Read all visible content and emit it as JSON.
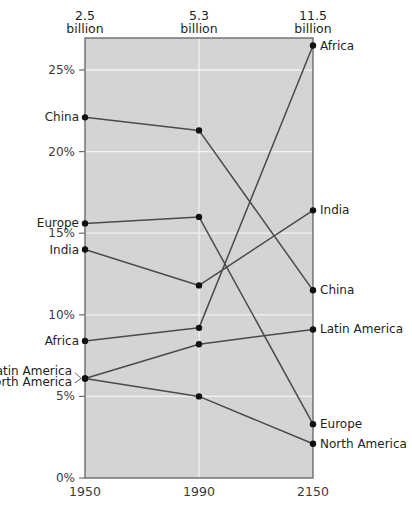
{
  "chart_data": {
    "type": "line",
    "title": "",
    "subtitle": "",
    "xlabel": "",
    "ylabel": "",
    "categories": [
      "1950",
      "1990",
      "2150"
    ],
    "x_tick_labels": [
      "1950",
      "1990",
      "2150"
    ],
    "column_headers": [
      {
        "number": "2.5",
        "unit": "billion"
      },
      {
        "number": "5.3",
        "unit": "billion"
      },
      {
        "number": "11.5",
        "unit": "billion"
      }
    ],
    "y_tick_labels": [
      "25%",
      "20%",
      "15%",
      "10%",
      "5%",
      "0%"
    ],
    "y_tick_values": [
      25,
      20,
      15,
      10,
      5,
      0
    ],
    "ylim": [
      0,
      29
    ],
    "grid": true,
    "legend_position": "inline-endpoints",
    "series": [
      {
        "name": "Africa",
        "values": [
          8.4,
          9.2,
          26.5
        ],
        "left_label": "Africa",
        "right_label": "Africa"
      },
      {
        "name": "China",
        "values": [
          22.1,
          21.3,
          11.5
        ],
        "left_label": "China",
        "right_label": "China"
      },
      {
        "name": "India",
        "values": [
          14.0,
          11.8,
          16.4
        ],
        "left_label": "India",
        "right_label": "India"
      },
      {
        "name": "Europe",
        "values": [
          15.6,
          16.0,
          3.3
        ],
        "left_label": "Europe",
        "right_label": "Europe"
      },
      {
        "name": "Latin America",
        "values": [
          6.1,
          8.2,
          9.1
        ],
        "left_label": "Latin America",
        "right_label": "Latin America"
      },
      {
        "name": "North America",
        "values": [
          6.1,
          5.0,
          2.1
        ],
        "left_label": "North America",
        "right_label": "North America"
      }
    ]
  },
  "axes": {
    "top_headers": [
      "2.5 billion",
      "5.3 billion",
      "11.5 billion"
    ],
    "bottom_ticks": [
      "1950",
      "1990",
      "2150"
    ]
  },
  "colors": {
    "plot_background": "#d4d4d4",
    "page_background": "#ffffff",
    "gridline": "#f2f2f2",
    "line": "#4a4a4a",
    "dot": "#111111",
    "text": "#231f20",
    "axis": "#6d6d6d"
  }
}
